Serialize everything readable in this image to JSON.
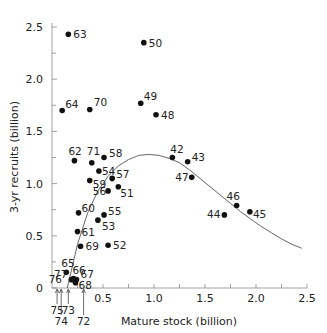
{
  "chart_data": {
    "type": "scatter",
    "title": "",
    "xlabel": "Mature stock (billion)",
    "ylabel": "3-yr recruits (billion)",
    "xlim": [
      0,
      2.5
    ],
    "ylim": [
      0,
      2.5
    ],
    "xticks": [
      "0.5",
      "1.0",
      "1.5",
      "2.0",
      "2.5"
    ],
    "yticks": [
      "0",
      "0.5",
      "1.0",
      "1.5",
      "2.0",
      "2.5"
    ],
    "grid": false,
    "points": [
      {
        "label": "63",
        "x": 0.16,
        "y": 2.43
      },
      {
        "label": "50",
        "x": 0.9,
        "y": 2.35
      },
      {
        "label": "64",
        "x": 0.1,
        "y": 1.7
      },
      {
        "label": "70",
        "x": 0.37,
        "y": 1.71
      },
      {
        "label": "49",
        "x": 0.87,
        "y": 1.77
      },
      {
        "label": "48",
        "x": 1.02,
        "y": 1.66
      },
      {
        "label": "62",
        "x": 0.22,
        "y": 1.22
      },
      {
        "label": "71",
        "x": 0.39,
        "y": 1.2
      },
      {
        "label": "58",
        "x": 0.51,
        "y": 1.25
      },
      {
        "label": "54",
        "x": 0.46,
        "y": 1.12
      },
      {
        "label": "59",
        "x": 0.37,
        "y": 1.03
      },
      {
        "label": "57",
        "x": 0.59,
        "y": 1.05
      },
      {
        "label": "56",
        "x": 0.55,
        "y": 0.93
      },
      {
        "label": "51",
        "x": 0.65,
        "y": 0.97
      },
      {
        "label": "60",
        "x": 0.26,
        "y": 0.72
      },
      {
        "label": "55",
        "x": 0.51,
        "y": 0.7
      },
      {
        "label": "53",
        "x": 0.45,
        "y": 0.65
      },
      {
        "label": "61",
        "x": 0.25,
        "y": 0.54
      },
      {
        "label": "69",
        "x": 0.28,
        "y": 0.4
      },
      {
        "label": "52",
        "x": 0.55,
        "y": 0.41
      },
      {
        "label": "65",
        "x": 0.14,
        "y": 0.15
      },
      {
        "label": "66",
        "x": 0.21,
        "y": 0.09
      },
      {
        "label": "67",
        "x": 0.24,
        "y": 0.08
      },
      {
        "label": "68",
        "x": 0.23,
        "y": 0.05
      },
      {
        "label": "77",
        "x": 0.19,
        "y": 0.08
      },
      {
        "label": "42",
        "x": 1.18,
        "y": 1.25
      },
      {
        "label": "43",
        "x": 1.33,
        "y": 1.21
      },
      {
        "label": "47",
        "x": 1.37,
        "y": 1.06
      },
      {
        "label": "46",
        "x": 1.81,
        "y": 0.79
      },
      {
        "label": "44",
        "x": 1.69,
        "y": 0.7
      },
      {
        "label": "45",
        "x": 1.94,
        "y": 0.73
      }
    ],
    "axis_annotations": [
      {
        "label": "76",
        "x": 0.02
      },
      {
        "label": "75",
        "x": 0.05
      },
      {
        "label": "74",
        "x": 0.09
      },
      {
        "label": "73",
        "x": 0.16
      },
      {
        "label": "72",
        "x": 0.31
      }
    ],
    "curve": {
      "name": "Ricker stock-recruitment fit",
      "x": [
        0.15,
        0.25,
        0.35,
        0.45,
        0.55,
        0.65,
        0.75,
        0.85,
        0.95,
        1.05,
        1.15,
        1.25,
        1.35,
        1.45,
        1.55,
        1.65,
        1.75,
        1.85,
        1.95,
        2.05,
        2.15,
        2.25,
        2.35,
        2.45
      ],
      "y": [
        0.0,
        0.42,
        0.72,
        0.93,
        1.07,
        1.17,
        1.23,
        1.27,
        1.28,
        1.27,
        1.24,
        1.2,
        1.13,
        1.05,
        0.97,
        0.89,
        0.81,
        0.73,
        0.66,
        0.59,
        0.53,
        0.47,
        0.42,
        0.38
      ]
    }
  }
}
